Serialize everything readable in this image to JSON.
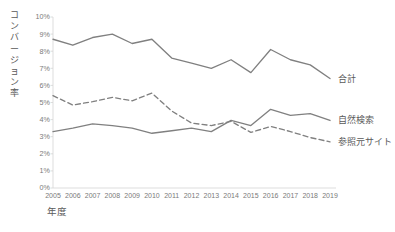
{
  "chart_data": {
    "type": "line",
    "title": "",
    "xlabel": "年度",
    "ylabel": "コンバージョン率",
    "x": [
      "2005",
      "2006",
      "2007",
      "2008",
      "2009",
      "2010",
      "2011",
      "2012",
      "2013",
      "2014",
      "2015",
      "2016",
      "2017",
      "2018",
      "2019"
    ],
    "categories": [
      "2005",
      "2006",
      "2007",
      "2008",
      "2009",
      "2010",
      "2011",
      "2012",
      "2013",
      "2014",
      "2015",
      "2016",
      "2017",
      "2018",
      "2019"
    ],
    "ylim": [
      0,
      10
    ],
    "ytick_labels": [
      "10%",
      "9%",
      "8%",
      "7%",
      "6%",
      "5%",
      "4%",
      "3%",
      "2%",
      "1%",
      "0%"
    ],
    "ytick_values": [
      10,
      9,
      8,
      7,
      6,
      5,
      4,
      3,
      2,
      1,
      0
    ],
    "grid": false,
    "legend_position": "right-end-labels",
    "series": [
      {
        "name": "合計",
        "style": "solid",
        "color": "#808080",
        "values": [
          8.7,
          8.35,
          8.8,
          9.0,
          8.45,
          8.7,
          7.6,
          7.3,
          7.0,
          7.5,
          6.75,
          8.1,
          7.5,
          7.2,
          6.4
        ]
      },
      {
        "name": "自然検索",
        "style": "solid",
        "color": "#808080",
        "values": [
          3.3,
          3.5,
          3.75,
          3.65,
          3.5,
          3.2,
          3.35,
          3.5,
          3.3,
          3.95,
          3.65,
          4.6,
          4.25,
          4.35,
          3.95
        ]
      },
      {
        "name": "参照元サイト",
        "style": "dashed",
        "color": "#808080",
        "values": [
          5.4,
          4.85,
          5.05,
          5.3,
          5.1,
          5.55,
          4.5,
          3.8,
          3.65,
          3.9,
          3.25,
          3.6,
          3.3,
          2.95,
          2.7
        ]
      }
    ]
  },
  "axes": {
    "y_title": "コンバージョン率",
    "x_title": "年度"
  }
}
